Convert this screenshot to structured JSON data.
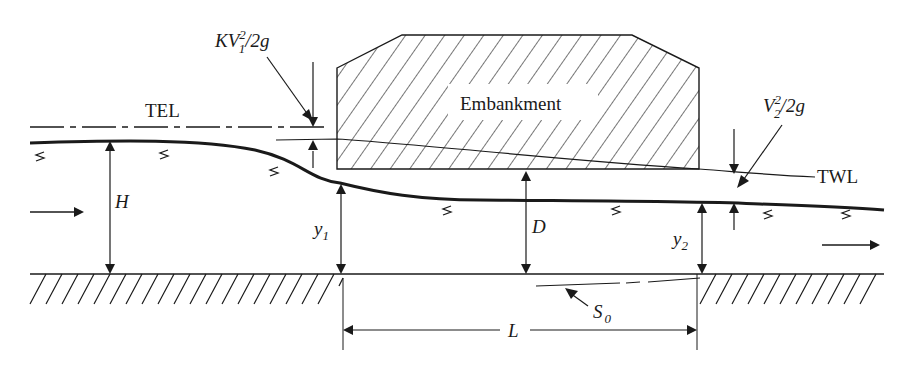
{
  "diagram": {
    "type": "hydraulic cross-section: flow over road embankment (culvert)",
    "labels": {
      "tel": "TEL",
      "twl": "TWL",
      "embankment": "Embankment",
      "entrance_loss": {
        "base": "KV",
        "sub": "1",
        "sup": "2",
        "tail": "/2g"
      },
      "exit_head": {
        "base": "V",
        "sub": "2",
        "sup": "2",
        "tail": "/2g"
      },
      "headwater_depth": "H",
      "y1": {
        "base": "y",
        "sub": "1"
      },
      "y2": {
        "base": "y",
        "sub": "2"
      },
      "culvert_height": "D",
      "length": "L",
      "slope": {
        "base": "S",
        "sub": "0"
      }
    },
    "colors": {
      "ink": "#1a1a1a",
      "background": "#ffffff"
    }
  }
}
